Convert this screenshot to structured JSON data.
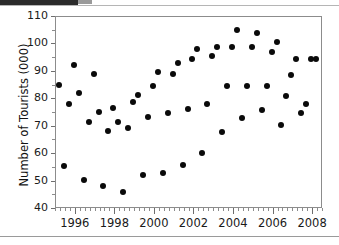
{
  "chart_data": {
    "type": "scatter",
    "title": "",
    "xlabel": "",
    "ylabel": "Number of Tourists (000)",
    "xlim": [
      1995.0,
      2008.5
    ],
    "ylim": [
      40,
      110
    ],
    "ytick_labels": [
      "110",
      "100",
      "90",
      "80",
      "70",
      "60",
      "50",
      "40"
    ],
    "ytick_values": [
      110,
      100,
      90,
      80,
      70,
      60,
      50,
      40
    ],
    "ytick_minor_step": 5,
    "xtick_labels": [
      "1996",
      "1998",
      "2000",
      "2002",
      "2004",
      "2006",
      "2008"
    ],
    "xtick_values": [
      1996,
      1998,
      2000,
      2002,
      2004,
      2006,
      2008
    ],
    "xtick_minor_step": 0.25,
    "grid": false,
    "legend": false,
    "marker": "filled-circle",
    "marker_color": "#0a0a0a",
    "x": [
      1995.2,
      1995.45,
      1995.7,
      1995.95,
      1996.2,
      1996.45,
      1996.7,
      1996.95,
      1997.2,
      1997.45,
      1997.7,
      1997.95,
      1998.2,
      1998.45,
      1998.7,
      1998.95,
      1999.2,
      1999.45,
      1999.7,
      1999.95,
      2000.2,
      2000.45,
      2000.7,
      2000.95,
      2001.2,
      2001.45,
      2001.7,
      2001.95,
      2002.2,
      2002.45,
      2002.7,
      2002.95,
      2003.2,
      2003.45,
      2003.7,
      2003.95,
      2004.2,
      2004.45,
      2004.7,
      2004.95,
      2005.2,
      2005.45,
      2005.7,
      2005.95,
      2006.2,
      2006.45,
      2006.7,
      2006.95,
      2007.2,
      2007.45,
      2007.7,
      2007.95,
      2008.2
    ],
    "y": [
      84.8,
      55.2,
      78.0,
      92.0,
      82.0,
      50.2,
      71.2,
      89.0,
      75.0,
      48.0,
      68.0,
      76.3,
      71.2,
      46.0,
      69.0,
      78.8,
      81.2,
      52.0,
      73.0,
      84.6,
      89.5,
      52.8,
      74.7,
      89.0,
      92.8,
      55.8,
      76.0,
      94.5,
      97.8,
      60.2,
      77.8,
      95.4,
      98.6,
      67.8,
      84.6,
      98.7,
      104.8,
      72.8,
      84.6,
      98.7,
      103.8,
      75.8,
      84.6,
      96.8,
      100.5,
      70.2,
      80.9,
      88.6,
      94.4,
      74.6,
      77.8,
      94.4,
      94.4
    ],
    "y_pixel_top_value": 110,
    "y_pixel_bottom_value": 40
  }
}
